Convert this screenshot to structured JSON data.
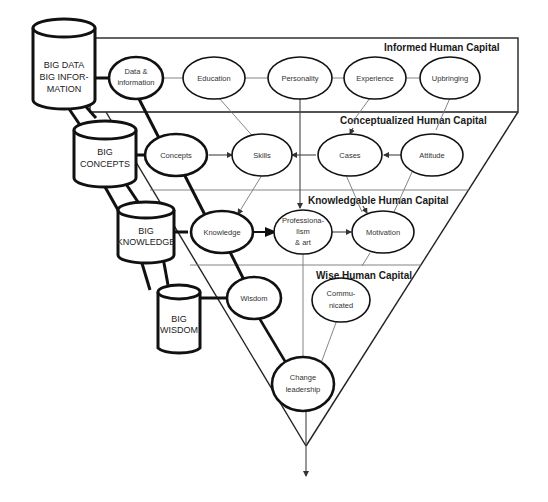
{
  "bands": [
    {
      "id": "informed",
      "title": "Informed Human Capital"
    },
    {
      "id": "conceptualized",
      "title": "Conceptualized Human Capital"
    },
    {
      "id": "knowledgable",
      "title": "Knowledgable Human Capital"
    },
    {
      "id": "wise",
      "title": "Wise Human Capital"
    }
  ],
  "cylinders": [
    {
      "id": "big-data",
      "lines": [
        "BIG DATA",
        "BIG INFOR-",
        "MATION"
      ]
    },
    {
      "id": "big-concepts",
      "lines": [
        "BIG",
        "CONCEPTS"
      ]
    },
    {
      "id": "big-knowledge",
      "lines": [
        "BIG",
        "KNOWLEDGE"
      ]
    },
    {
      "id": "big-wisdom",
      "lines": [
        "BIG",
        "WISDOM"
      ]
    }
  ],
  "nodes": {
    "data_information": [
      "Data &",
      "information"
    ],
    "education": [
      "Education"
    ],
    "personality": [
      "Personality"
    ],
    "experience": [
      "Experience"
    ],
    "upbringing": [
      "Upbringing"
    ],
    "concepts": [
      "Concepts"
    ],
    "skills": [
      "Skills"
    ],
    "cases": [
      "Cases"
    ],
    "attitude": [
      "Attitude"
    ],
    "knowledge": [
      "Knowledge"
    ],
    "professionalism": [
      "Professiona-",
      "lism",
      "& art"
    ],
    "motivation": [
      "Motivation"
    ],
    "wisdom": [
      "Wisdom"
    ],
    "communicated": [
      "Commu-",
      "nicated"
    ],
    "change_leadership": [
      "Change",
      "leadership"
    ]
  },
  "colors": {
    "stroke": "#111111",
    "background": "#ffffff",
    "thin_line": "#777777"
  }
}
